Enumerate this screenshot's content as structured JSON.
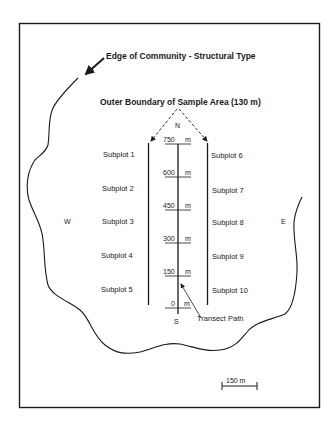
{
  "diagram": {
    "edge_label": "Edge of Community - Structural Type",
    "boundary_label": "Outer Boundary of Sample Area (130 m)",
    "compass": {
      "north": "N",
      "south": "S",
      "west": "W",
      "east": "E"
    },
    "transect_label": "Transect Path",
    "scale_bar": "150 m",
    "left_subplots": [
      "Subplot 1",
      "Subplot 2",
      "Subplot 3",
      "Subplot 4",
      "Subplot 5"
    ],
    "right_subplots": [
      "Subplot 6",
      "Subplot 7",
      "Subplot 8",
      "Subplot 9",
      "Subplot 10"
    ],
    "distance_markers": [
      {
        "value": "750",
        "unit": "m"
      },
      {
        "value": "600",
        "unit": "m"
      },
      {
        "value": "450",
        "unit": "m"
      },
      {
        "value": "300",
        "unit": "m"
      },
      {
        "value": "150",
        "unit": "m"
      },
      {
        "value": "0",
        "unit": "m"
      }
    ],
    "colors": {
      "ink": "#1a1a1a",
      "background": "#ffffff"
    }
  }
}
